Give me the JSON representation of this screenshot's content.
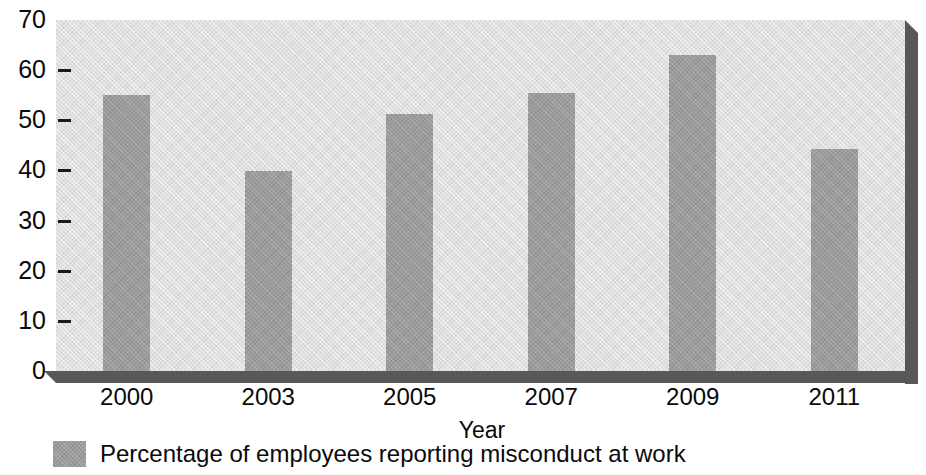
{
  "chart_data": {
    "type": "bar",
    "title": "",
    "subtitle": "",
    "categories": [
      "2000",
      "2003",
      "2005",
      "2007",
      "2009",
      "2011"
    ],
    "values": [
      55.1,
      39.9,
      51.3,
      55.5,
      63.0,
      44.2
    ],
    "series": [
      {
        "name": "Percentage of employees reporting misconduct at work",
        "values": [
          55.1,
          39.9,
          51.3,
          55.5,
          63.0,
          44.2
        ]
      }
    ],
    "xlabel": "Year",
    "ylabel": "",
    "ylim": [
      0,
      70
    ],
    "xlim": null,
    "ytick_labels": [
      "0",
      "10",
      "20",
      "30",
      "40",
      "50",
      "60",
      "70"
    ],
    "ytick_values": [
      0,
      10,
      20,
      30,
      40,
      50,
      60,
      70
    ],
    "grid": false,
    "legend_position": "bottom-left",
    "legend_entries": [
      "Percentage of employees reporting misconduct at work"
    ],
    "annotations": [],
    "colors": {
      "bar": "#9b9b9b",
      "plot_background": "#e0e0e0",
      "bevel_shadow": "#585858",
      "text": "#0a0a0a",
      "page_background": "#ffffff"
    }
  },
  "axes": {
    "x_title": "Year",
    "y_title": ""
  },
  "legend": {
    "swatch_name": "bar-color-swatch",
    "label": "Percentage of employees reporting misconduct at work"
  }
}
